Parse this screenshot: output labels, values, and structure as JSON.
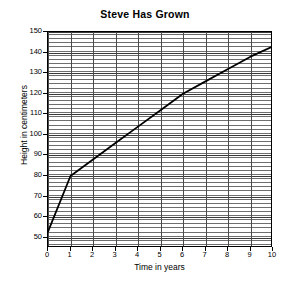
{
  "chart_data": {
    "type": "line",
    "title": "Steve Has Grown",
    "xlabel": "Time in years",
    "ylabel": "Height in centimeters",
    "x": [
      0,
      1,
      2,
      3,
      4,
      5,
      6,
      7,
      8,
      9,
      10
    ],
    "values": [
      53,
      80,
      88,
      96,
      104,
      112,
      120,
      126,
      132,
      138,
      143
    ],
    "series": [
      {
        "name": "Height",
        "values": [
          53,
          80,
          88,
          96,
          104,
          112,
          120,
          126,
          132,
          138,
          143
        ]
      }
    ],
    "xlim": [
      0,
      10
    ],
    "ylim": [
      45,
      150
    ],
    "xticks": [
      "0",
      "1",
      "2",
      "3",
      "4",
      "5",
      "6",
      "7",
      "8",
      "9",
      "10"
    ],
    "yticks": [
      "50",
      "60",
      "70",
      "80",
      "90",
      "100",
      "110",
      "120",
      "130",
      "140",
      "150"
    ],
    "ytick_values": [
      50,
      60,
      70,
      80,
      90,
      100,
      110,
      120,
      130,
      140,
      150
    ],
    "grid": true,
    "grid_minor_y_step": 2,
    "legend": null,
    "line_color": "#000000"
  }
}
